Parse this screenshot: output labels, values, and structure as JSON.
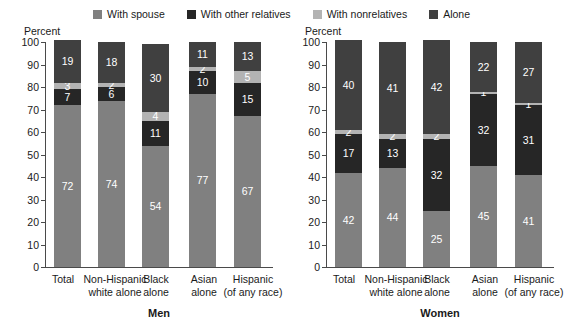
{
  "legend": {
    "items": [
      {
        "label": "With spouse",
        "color": "#808080"
      },
      {
        "label": "With other relatives",
        "color": "#262626"
      },
      {
        "label": "With nonrelatives",
        "color": "#b3b3b3"
      },
      {
        "label": "Alone",
        "color": "#404040"
      }
    ]
  },
  "axis": {
    "y_title": "Percent",
    "ticks": [
      "100",
      "90",
      "80",
      "70",
      "60",
      "50",
      "40",
      "30",
      "20",
      "10",
      "0"
    ]
  },
  "panels": [
    {
      "id": "men",
      "title": "Men"
    },
    {
      "id": "women",
      "title": "Women"
    }
  ],
  "categories": [
    {
      "line1": "Total",
      "line2": ""
    },
    {
      "line1": "Non-Hispanic",
      "line2": "white alone"
    },
    {
      "line1": "Black",
      "line2": "alone"
    },
    {
      "line1": "Asian",
      "line2": "alone"
    },
    {
      "line1": "Hispanic",
      "line2": "(of any race)"
    }
  ],
  "chart_data": {
    "type": "bar",
    "subtype": "stacked-bar",
    "ylabel": "Percent",
    "xlabel": "",
    "ylim": [
      0,
      100
    ],
    "ytick_step": 10,
    "grid": false,
    "legend_position": "top-center",
    "series_names": [
      "With spouse",
      "With other relatives",
      "With nonrelatives",
      "Alone"
    ],
    "categories": [
      "Total",
      "Non-Hispanic white alone",
      "Black alone",
      "Asian alone",
      "Hispanic (of any race)"
    ],
    "panels": [
      {
        "name": "Men",
        "series": [
          {
            "name": "With spouse",
            "values": [
              72,
              74,
              54,
              77,
              67
            ]
          },
          {
            "name": "With other relatives",
            "values": [
              7,
              6,
              11,
              10,
              15
            ]
          },
          {
            "name": "With nonrelatives",
            "values": [
              3,
              2,
              4,
              2,
              5
            ]
          },
          {
            "name": "Alone",
            "values": [
              19,
              18,
              30,
              11,
              13
            ]
          }
        ]
      },
      {
        "name": "Women",
        "series": [
          {
            "name": "With spouse",
            "values": [
              42,
              44,
              25,
              45,
              41
            ]
          },
          {
            "name": "With other relatives",
            "values": [
              17,
              13,
              32,
              32,
              31
            ]
          },
          {
            "name": "With nonrelatives",
            "values": [
              2,
              2,
              2,
              1,
              1
            ]
          },
          {
            "name": "Alone",
            "values": [
              40,
              41,
              42,
              22,
              27
            ]
          }
        ]
      }
    ]
  }
}
